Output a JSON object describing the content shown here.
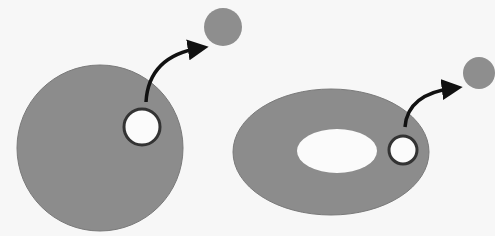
{
  "diagram": {
    "colors": {
      "background": "#f7f7f7",
      "body_fill": "#8c8c8c",
      "hole_fill": "#fbfbfb",
      "hole_stroke": "#333333",
      "arrow": "#111111",
      "particle_fill": "#8e8e8e"
    },
    "left_panel": {
      "shape": "circle",
      "body": {
        "cx": 100,
        "cy": 148,
        "r": 83
      },
      "hole": {
        "cx": 142,
        "cy": 127,
        "r": 18
      },
      "arrow": {
        "from": [
          146,
          102
        ],
        "to": [
          200,
          48
        ]
      },
      "particle": {
        "cx": 223,
        "cy": 27,
        "r": 19
      }
    },
    "right_panel": {
      "shape": "ellipse",
      "body": {
        "cx": 331,
        "cy": 152,
        "rx": 98,
        "ry": 63
      },
      "inner_hole": {
        "cx": 337,
        "cy": 151,
        "rx": 40,
        "ry": 22
      },
      "hole": {
        "cx": 403,
        "cy": 150,
        "r": 14
      },
      "arrow": {
        "from": [
          405,
          127
        ],
        "to": [
          454,
          88
        ]
      },
      "particle": {
        "cx": 479,
        "cy": 73,
        "r": 16
      }
    }
  }
}
